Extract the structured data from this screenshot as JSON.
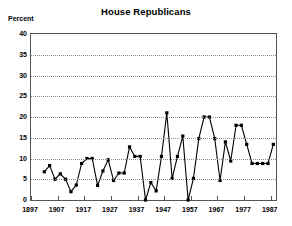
{
  "chart_data": {
    "type": "line",
    "title": "House Republicans",
    "ylabel": "Percent",
    "xlabel": "",
    "ylim": [
      0,
      40
    ],
    "ytick_step": 5,
    "yticks": [
      0,
      5,
      10,
      15,
      20,
      25,
      30,
      35,
      40
    ],
    "xlim": [
      1897,
      1989
    ],
    "xticks": [
      1897,
      1907,
      1917,
      1927,
      1937,
      1947,
      1957,
      1967,
      1977,
      1987
    ],
    "xtick_labels": [
      "1897",
      "1907",
      "1917",
      "1927",
      "1937",
      "1947",
      "1957",
      "1967",
      "1977",
      "1987"
    ],
    "grid": "horizontal-dotted",
    "legend": "none",
    "marker": "filled-square",
    "line_color": "#000000",
    "marker_color": "#000000",
    "grid_color": "#8a8a8a",
    "frame_color": "#555555",
    "x": [
      1902,
      1904,
      1906,
      1908,
      1910,
      1912,
      1914,
      1916,
      1918,
      1920,
      1922,
      1924,
      1926,
      1928,
      1930,
      1932,
      1934,
      1936,
      1938,
      1940,
      1942,
      1944,
      1946,
      1948,
      1950,
      1952,
      1954,
      1956,
      1958,
      1960,
      1962,
      1964,
      1966,
      1968,
      1970,
      1972,
      1974,
      1976,
      1978,
      1980,
      1982,
      1984,
      1986,
      1988
    ],
    "values": [
      6.8,
      8.3,
      5.0,
      6.3,
      5.0,
      2.0,
      3.6,
      8.8,
      10.0,
      10.0,
      3.5,
      7.0,
      9.7,
      4.7,
      6.5,
      6.5,
      12.8,
      10.5,
      10.5,
      0.0,
      4.2,
      2.2,
      10.5,
      21.0,
      5.2,
      10.5,
      15.4,
      0.0,
      5.2,
      14.8,
      20.0,
      20.0,
      14.8,
      4.7,
      14.0,
      9.4,
      18.0,
      18.0,
      13.4,
      8.8,
      8.8,
      8.8,
      8.8,
      13.4
    ],
    "series": [
      {
        "name": "House Republicans",
        "values": [
          6.8,
          8.3,
          5.0,
          6.3,
          5.0,
          2.0,
          3.6,
          8.8,
          10.0,
          10.0,
          3.5,
          7.0,
          9.7,
          4.7,
          6.5,
          6.5,
          12.8,
          10.5,
          10.5,
          0.0,
          4.2,
          2.2,
          10.5,
          21.0,
          5.2,
          10.5,
          15.4,
          0.0,
          5.2,
          14.8,
          20.0,
          20.0,
          14.8,
          4.7,
          14.0,
          9.4,
          18.0,
          18.0,
          13.4,
          8.8,
          8.8,
          8.8,
          8.8,
          13.4
        ]
      }
    ]
  }
}
